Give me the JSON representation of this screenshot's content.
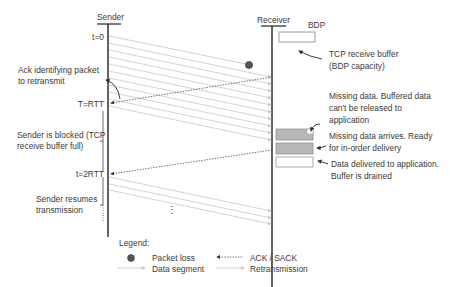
{
  "diagram": {
    "actors": {
      "sender": "Sender",
      "receiver": "Receiver"
    },
    "time_marks": {
      "t0": "t=0",
      "rtt": "T=RTT",
      "two_rtt": "t=2RTT"
    },
    "buffer": {
      "label": "BDP",
      "description_line1": "TCP receive buffer",
      "description_line2": "(BDP capacity)"
    },
    "annotations": {
      "ack_identifying_line1": "Ack identifying packet",
      "ack_identifying_line2": "to retransmit",
      "sender_blocked_line1": "Sender is blocked (TCP",
      "sender_blocked_line2": "receive buffer full)",
      "sender_resumes_line1": "Sender resumes",
      "sender_resumes_line2": "transmission",
      "missing_data_line1": "Missing data. Buffered data",
      "missing_data_line2": "can't be released to",
      "missing_data_line3": "application",
      "missing_arrives_line1": "Missing data arrives. Ready",
      "missing_arrives_line2": "for in-order delivery",
      "delivered_line1": "Data delivered to application.",
      "delivered_line2": "Buffer is drained",
      "continuation": "⋮"
    },
    "legend": {
      "title": "Legend:",
      "items": [
        {
          "symbol": "dot",
          "label": "Packet loss"
        },
        {
          "symbol": "solid-arrow",
          "label": "Data segment"
        },
        {
          "symbol": "dotted-arrow-left",
          "label": "ACK / SACK"
        },
        {
          "symbol": "solid-arrow",
          "label": "Retransmission"
        }
      ]
    },
    "colors": {
      "line": "#222222",
      "segment": "#c8c8c8",
      "ack": "#555555",
      "loss_dot": "#555555",
      "buffer_fill": "#b8b8b8"
    }
  }
}
